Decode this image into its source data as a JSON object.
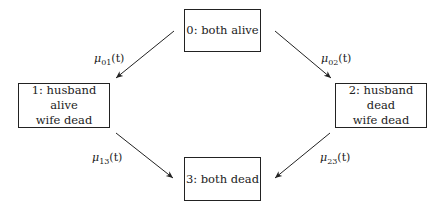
{
  "diagram": {
    "type": "multi-state model",
    "states": [
      {
        "id": 0,
        "line1": "0: both alive",
        "line2": ""
      },
      {
        "id": 1,
        "line1": "1: husband alive",
        "line2": "wife dead"
      },
      {
        "id": 2,
        "line1": "2: husband dead",
        "line2": "wife dead"
      },
      {
        "id": 3,
        "line1": "3: both dead",
        "line2": ""
      }
    ],
    "transitions": [
      {
        "from": 0,
        "to": 1,
        "symbol": "μ",
        "sub": "01",
        "arg": "(t)"
      },
      {
        "from": 0,
        "to": 2,
        "symbol": "μ",
        "sub": "02",
        "arg": "(t)"
      },
      {
        "from": 1,
        "to": 3,
        "symbol": "μ",
        "sub": "13",
        "arg": "(t)"
      },
      {
        "from": 2,
        "to": 3,
        "symbol": "μ",
        "sub": "23",
        "arg": "(t)"
      }
    ],
    "colors": {
      "stroke": "#222222",
      "background": "#ffffff"
    }
  }
}
